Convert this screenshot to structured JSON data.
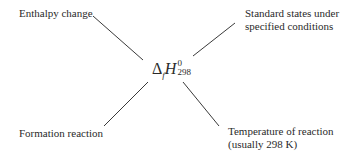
{
  "diagram": {
    "center_formula": {
      "delta": "Δ",
      "subscript_f": "f",
      "symbol": "H",
      "superscript": "0",
      "subscript_temp": "298"
    },
    "labels": {
      "top_left": "Enthalpy change",
      "top_right_line1": "Standard states under",
      "top_right_line2": "specified conditions",
      "bottom_left": "Formation reaction",
      "bottom_right_line1": "Temperature of reaction",
      "bottom_right_line2": "(usually 298 K)"
    },
    "line_color": "#3a3a3a"
  }
}
